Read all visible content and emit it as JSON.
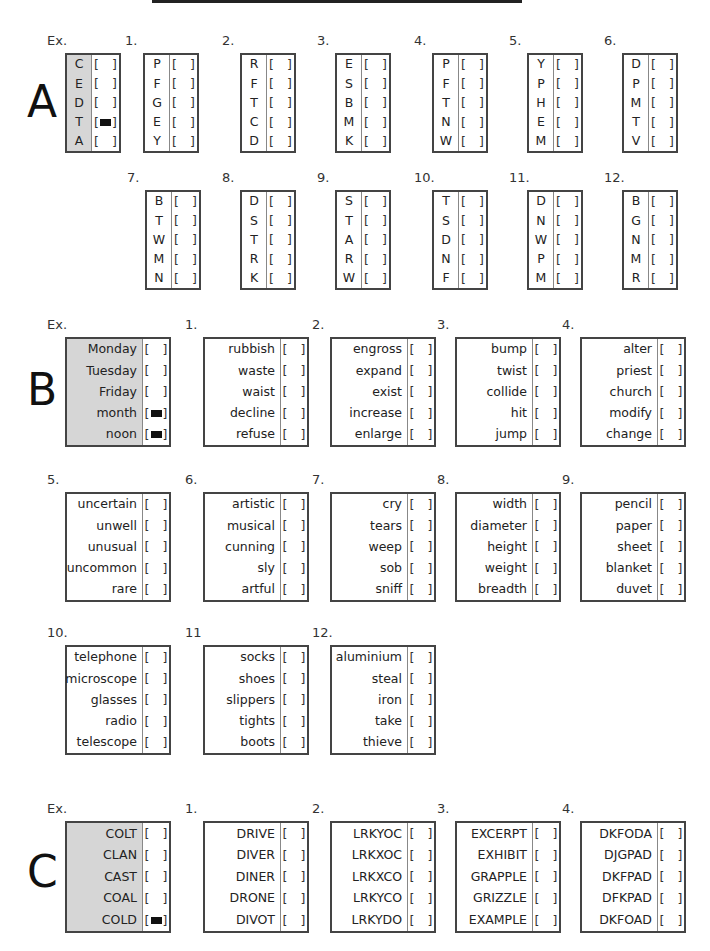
{
  "header": {
    "top_rule": true
  },
  "sections": [
    {
      "id": "A",
      "letter": "A",
      "questions": [
        {
          "label": "Ex.",
          "example": true,
          "items": [
            "C",
            "E",
            "D",
            "T",
            "A"
          ],
          "marked": [
            3
          ]
        },
        {
          "label": "1.",
          "items": [
            "P",
            "F",
            "G",
            "E",
            "Y"
          ],
          "marked": []
        },
        {
          "label": "2.",
          "items": [
            "R",
            "F",
            "T",
            "C",
            "D"
          ],
          "marked": []
        },
        {
          "label": "3.",
          "items": [
            "E",
            "S",
            "B",
            "M",
            "K"
          ],
          "marked": []
        },
        {
          "label": "4.",
          "items": [
            "P",
            "F",
            "T",
            "N",
            "W"
          ],
          "marked": []
        },
        {
          "label": "5.",
          "items": [
            "Y",
            "P",
            "H",
            "E",
            "M"
          ],
          "marked": []
        },
        {
          "label": "6.",
          "items": [
            "D",
            "P",
            "M",
            "T",
            "V"
          ],
          "marked": []
        },
        {
          "label": "7.",
          "items": [
            "B",
            "T",
            "W",
            "M",
            "N"
          ],
          "marked": []
        },
        {
          "label": "8.",
          "items": [
            "D",
            "S",
            "T",
            "R",
            "K"
          ],
          "marked": []
        },
        {
          "label": "9.",
          "items": [
            "S",
            "T",
            "A",
            "R",
            "W"
          ],
          "marked": []
        },
        {
          "label": "10.",
          "items": [
            "T",
            "S",
            "D",
            "N",
            "F"
          ],
          "marked": []
        },
        {
          "label": "11.",
          "items": [
            "D",
            "N",
            "W",
            "P",
            "M"
          ],
          "marked": []
        },
        {
          "label": "12.",
          "items": [
            "B",
            "G",
            "N",
            "M",
            "R"
          ],
          "marked": []
        }
      ]
    },
    {
      "id": "B",
      "letter": "B",
      "questions": [
        {
          "label": "Ex.",
          "example": true,
          "items": [
            "Monday",
            "Tuesday",
            "Friday",
            "month",
            "noon"
          ],
          "marked": [
            3,
            4
          ]
        },
        {
          "label": "1.",
          "items": [
            "rubbish",
            "waste",
            "waist",
            "decline",
            "refuse"
          ],
          "marked": []
        },
        {
          "label": "2.",
          "items": [
            "engross",
            "expand",
            "exist",
            "increase",
            "enlarge"
          ],
          "marked": []
        },
        {
          "label": "3.",
          "items": [
            "bump",
            "twist",
            "collide",
            "hit",
            "jump"
          ],
          "marked": []
        },
        {
          "label": "4.",
          "items": [
            "alter",
            "priest",
            "church",
            "modify",
            "change"
          ],
          "marked": []
        },
        {
          "label": "5.",
          "items": [
            "uncertain",
            "unwell",
            "unusual",
            "uncommon",
            "rare"
          ],
          "marked": []
        },
        {
          "label": "6.",
          "items": [
            "artistic",
            "musical",
            "cunning",
            "sly",
            "artful"
          ],
          "marked": []
        },
        {
          "label": "7.",
          "items": [
            "cry",
            "tears",
            "weep",
            "sob",
            "sniff"
          ],
          "marked": []
        },
        {
          "label": "8.",
          "items": [
            "width",
            "diameter",
            "height",
            "weight",
            "breadth"
          ],
          "marked": []
        },
        {
          "label": "9.",
          "items": [
            "pencil",
            "paper",
            "sheet",
            "blanket",
            "duvet"
          ],
          "marked": []
        },
        {
          "label": "10.",
          "items": [
            "telephone",
            "microscope",
            "glasses",
            "radio",
            "telescope"
          ],
          "marked": []
        },
        {
          "label": "11",
          "items": [
            "socks",
            "shoes",
            "slippers",
            "tights",
            "boots"
          ],
          "marked": []
        },
        {
          "label": "12.",
          "items": [
            "aluminium",
            "steal",
            "iron",
            "take",
            "thieve"
          ],
          "marked": []
        }
      ]
    },
    {
      "id": "C",
      "letter": "C",
      "questions": [
        {
          "label": "Ex.",
          "example": true,
          "items": [
            "COLT",
            "CLAN",
            "CAST",
            "COAL",
            "COLD"
          ],
          "marked": [
            4
          ]
        },
        {
          "label": "1.",
          "items": [
            "DRIVE",
            "DIVER",
            "DINER",
            "DRONE",
            "DIVOT"
          ],
          "marked": []
        },
        {
          "label": "2.",
          "items": [
            "LRKYOC",
            "LRKXOC",
            "LRKXCO",
            "LRKYCO",
            "LRKYDO"
          ],
          "marked": []
        },
        {
          "label": "3.",
          "items": [
            "EXCERPT",
            "EXHIBIT",
            "GRAPPLE",
            "GRIZZLE",
            "EXAMPLE"
          ],
          "marked": []
        },
        {
          "label": "4.",
          "items": [
            "DKFODA",
            "DJGPAD",
            "DKFPAD",
            "DFKPAD",
            "DKFOAD"
          ],
          "marked": []
        }
      ]
    }
  ],
  "bracket": {
    "open": "[",
    "close": "]"
  },
  "colors": {
    "example_shade": "#d6d6d6",
    "border": "#444444",
    "mark": "#111111"
  }
}
